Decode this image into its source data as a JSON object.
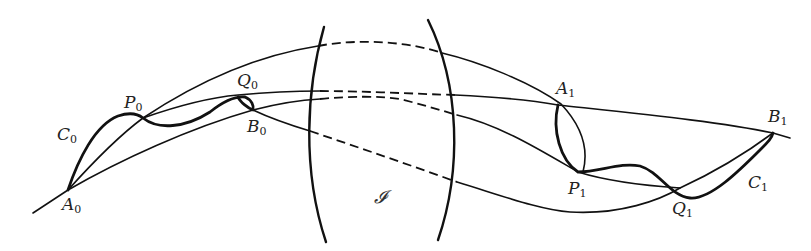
{
  "figure": {
    "region_label": "𝓘",
    "labels": {
      "A0": {
        "base": "A",
        "sub": "0"
      },
      "P0": {
        "base": "P",
        "sub": "0"
      },
      "Q0": {
        "base": "Q",
        "sub": "0"
      },
      "B0": {
        "base": "B",
        "sub": "0"
      },
      "C0": {
        "base": "C",
        "sub": "0"
      },
      "A1": {
        "base": "A",
        "sub": "1"
      },
      "P1": {
        "base": "P",
        "sub": "1"
      },
      "Q1": {
        "base": "Q",
        "sub": "1"
      },
      "B1": {
        "base": "B",
        "sub": "1"
      },
      "C1": {
        "base": "C",
        "sub": "1"
      }
    },
    "colors": {
      "ink": "#111111",
      "background": "#ffffff"
    }
  }
}
